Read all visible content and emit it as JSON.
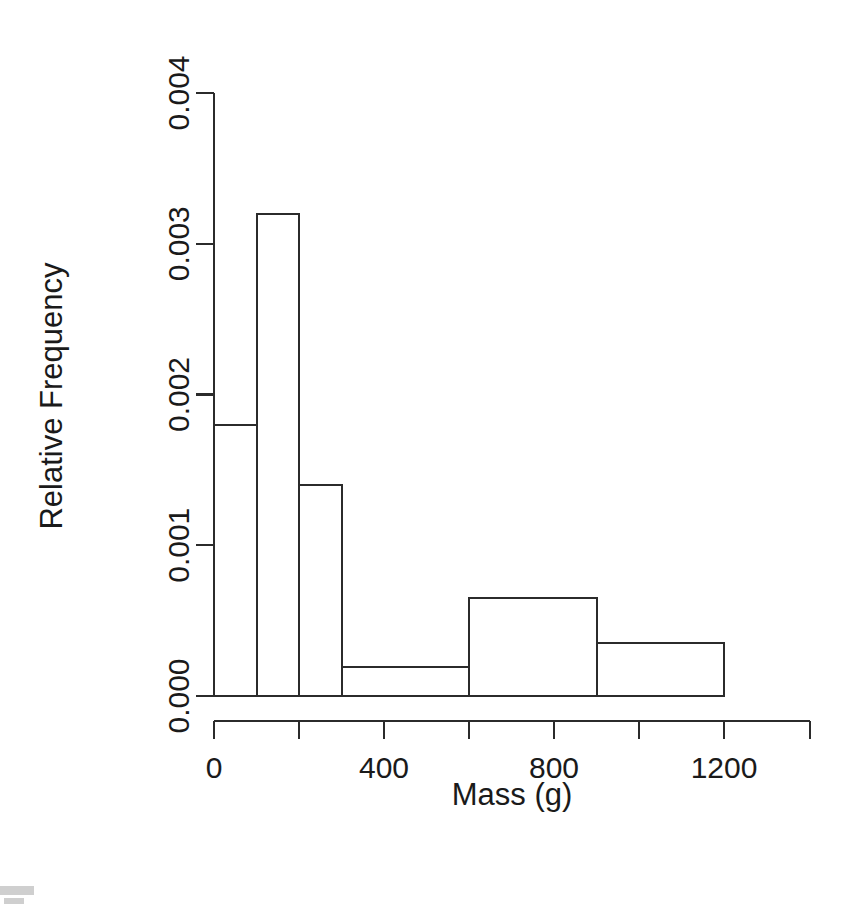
{
  "chart_data": {
    "type": "bar",
    "title": "",
    "subtitle": "",
    "xlabel": "Mass (g)",
    "ylabel": "Relative Frequency",
    "grid": false,
    "legend": false,
    "legend_position": "none",
    "style": "histogram-unequal-bins-r-base",
    "xlim": [
      0,
      1400
    ],
    "ylim": [
      0,
      0.004
    ],
    "x_ticks": [
      0,
      200,
      400,
      600,
      800,
      1000,
      1200
    ],
    "x_tick_labels": [
      "0",
      "",
      "400",
      "",
      "800",
      "",
      "1200"
    ],
    "x_labeled_ticks": [
      {
        "value": 0,
        "label": "0"
      },
      {
        "value": 400,
        "label": "400"
      },
      {
        "value": 800,
        "label": "800"
      },
      {
        "value": 1200,
        "label": "1200"
      }
    ],
    "y_ticks": [
      0.0,
      0.001,
      0.002,
      0.003,
      0.004
    ],
    "y_tick_labels": [
      "0.000",
      "0.001",
      "0.002",
      "0.003",
      "0.004"
    ],
    "bin_edges": [
      0,
      100,
      200,
      300,
      600,
      900,
      1200
    ],
    "bins": [
      {
        "x0": 0,
        "x1": 100,
        "density": 0.0018
      },
      {
        "x0": 100,
        "x1": 200,
        "density": 0.0032
      },
      {
        "x0": 200,
        "x1": 300,
        "density": 0.0014
      },
      {
        "x0": 300,
        "x1": 600,
        "density": 0.00019
      },
      {
        "x0": 600,
        "x1": 900,
        "density": 0.00065
      },
      {
        "x0": 900,
        "x1": 1200,
        "density": 0.00035
      }
    ],
    "categories": [
      "0-100",
      "100-200",
      "200-300",
      "300-600",
      "600-900",
      "900-1200"
    ],
    "values": [
      0.0018,
      0.0032,
      0.0014,
      0.00019,
      0.00065,
      0.00035
    ],
    "colors": {
      "bar_fill": "#ffffff",
      "bar_stroke": "#2b2b2b",
      "axis": "#2b2b2b",
      "text": "#1a1a1a",
      "background": "#ffffff"
    }
  },
  "figure": {
    "background": "#ffffff",
    "x_axis_title": "Mass (g)",
    "y_axis_title": "Relative Frequency"
  }
}
